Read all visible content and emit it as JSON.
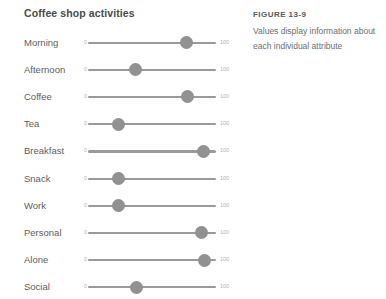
{
  "panel": {
    "title": "Coffee shop activities",
    "scale": {
      "min_label": "0",
      "max_label": "100",
      "min": 0,
      "max": 100
    },
    "rows": [
      {
        "label": "Morning",
        "value": 77
      },
      {
        "label": "Afternoon",
        "value": 37
      },
      {
        "label": "Coffee",
        "value": 78
      },
      {
        "label": "Tea",
        "value": 24
      },
      {
        "label": "Breakfast",
        "value": 90
      },
      {
        "label": "Snack",
        "value": 24
      },
      {
        "label": "Work",
        "value": 24
      },
      {
        "label": "Personal",
        "value": 89
      },
      {
        "label": "Alone",
        "value": 91
      },
      {
        "label": "Social",
        "value": 38
      }
    ]
  },
  "caption": {
    "heading": "FIGURE 13-9",
    "body": "Values display information about each individual attribute"
  },
  "colors": {
    "track": "#9a9a9a",
    "handle": "#919191",
    "tick_text": "#b3b3b3",
    "label_text": "#5d5d5d",
    "title_text": "#4a4a4a",
    "caption_heading": "#56585a",
    "caption_body": "#6b6d6f",
    "background": "#ffffff"
  }
}
